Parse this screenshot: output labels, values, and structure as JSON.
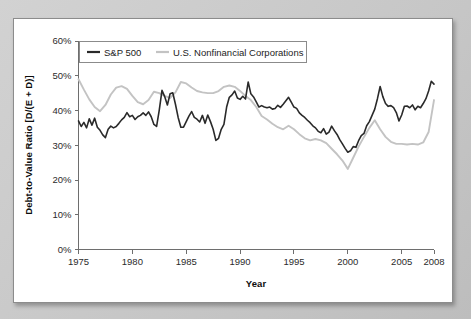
{
  "figure": {
    "background_color": "#ffffff",
    "page_background_color": "#c9c9c9",
    "border_color": "#8c8c8c"
  },
  "chart_data": {
    "type": "line",
    "title": "",
    "xlabel": "Year",
    "ylabel": "Debt-to-Value Ratio [D/(E + D)]",
    "xlim": [
      1975,
      2008
    ],
    "ylim": [
      0,
      60
    ],
    "grid": false,
    "legend_position": "top-left-inside",
    "xticks": [
      1975,
      1980,
      1985,
      1990,
      1995,
      2000,
      2005,
      2008
    ],
    "xticklabels": [
      "1975",
      "1980",
      "1985",
      "1990",
      "1995",
      "2000",
      "2005",
      "2008"
    ],
    "yticks": [
      0,
      10,
      20,
      30,
      40,
      50,
      60
    ],
    "yticklabels": [
      "0%",
      "10%",
      "20%",
      "30%",
      "40%",
      "50%",
      "60%"
    ],
    "series": [
      {
        "name": "S&P 500",
        "color": "#2a2a2a",
        "width": 1.6,
        "x": [
          1975.0,
          1975.25,
          1975.5,
          1975.75,
          1976.0,
          1976.25,
          1976.5,
          1976.75,
          1977.0,
          1977.25,
          1977.5,
          1977.75,
          1978.0,
          1978.25,
          1978.5,
          1978.75,
          1979.0,
          1979.25,
          1979.5,
          1979.75,
          1980.0,
          1980.25,
          1980.5,
          1980.75,
          1981.0,
          1981.25,
          1981.5,
          1981.75,
          1982.0,
          1982.25,
          1982.5,
          1982.75,
          1983.0,
          1983.25,
          1983.5,
          1983.75,
          1984.0,
          1984.25,
          1984.5,
          1984.75,
          1985.0,
          1985.25,
          1985.5,
          1985.75,
          1986.0,
          1986.25,
          1986.5,
          1986.75,
          1987.0,
          1987.25,
          1987.5,
          1987.75,
          1988.0,
          1988.25,
          1988.5,
          1988.75,
          1989.0,
          1989.25,
          1989.5,
          1989.75,
          1990.0,
          1990.25,
          1990.5,
          1990.75,
          1991.0,
          1991.25,
          1991.5,
          1991.75,
          1992.0,
          1992.25,
          1992.5,
          1992.75,
          1993.0,
          1993.25,
          1993.5,
          1993.75,
          1994.0,
          1994.25,
          1994.5,
          1994.75,
          1995.0,
          1995.25,
          1995.5,
          1995.75,
          1996.0,
          1996.25,
          1996.5,
          1996.75,
          1997.0,
          1997.25,
          1997.5,
          1997.75,
          1998.0,
          1998.25,
          1998.5,
          1998.75,
          1999.0,
          1999.25,
          1999.5,
          1999.75,
          2000.0,
          2000.25,
          2000.5,
          2000.75,
          2001.0,
          2001.25,
          2001.5,
          2001.75,
          2002.0,
          2002.25,
          2002.5,
          2002.75,
          2003.0,
          2003.25,
          2003.5,
          2003.75,
          2004.0,
          2004.25,
          2004.5,
          2004.75,
          2005.0,
          2005.25,
          2005.5,
          2005.75,
          2006.0,
          2006.25,
          2006.5,
          2006.75,
          2007.0,
          2007.25,
          2007.5,
          2007.75,
          2008.0
        ],
        "y": [
          37.0,
          35.4,
          36.6,
          35.0,
          37.6,
          35.8,
          37.8,
          35.2,
          34.3,
          33.0,
          32.2,
          34.6,
          35.5,
          35.0,
          35.4,
          36.3,
          37.3,
          38.0,
          39.4,
          38.2,
          38.6,
          37.4,
          38.2,
          38.6,
          39.3,
          38.6,
          39.6,
          38.2,
          36.0,
          35.4,
          40.2,
          45.8,
          44.0,
          41.6,
          44.8,
          45.1,
          41.8,
          38.0,
          35.2,
          35.2,
          36.8,
          38.4,
          39.7,
          38.0,
          37.5,
          36.7,
          38.6,
          36.3,
          38.7,
          36.8,
          34.6,
          31.4,
          32.0,
          34.6,
          36.0,
          41.0,
          43.8,
          44.5,
          45.6,
          43.6,
          43.2,
          44.1,
          43.3,
          48.2,
          44.8,
          43.9,
          42.5,
          41.0,
          41.4,
          41.0,
          40.8,
          41.0,
          40.4,
          40.6,
          41.5,
          40.9,
          41.8,
          42.8,
          43.8,
          42.4,
          41.0,
          40.6,
          39.3,
          38.6,
          38.0,
          37.2,
          36.5,
          35.6,
          35.0,
          34.0,
          33.6,
          34.8,
          33.2,
          33.8,
          35.5,
          34.2,
          33.1,
          31.6,
          30.4,
          29.1,
          28.0,
          28.4,
          29.6,
          29.4,
          31.3,
          32.8,
          33.4,
          35.6,
          36.8,
          38.6,
          40.4,
          43.4,
          46.9,
          44.0,
          42.0,
          41.2,
          41.4,
          40.8,
          39.4,
          37.0,
          38.7,
          41.2,
          41.3,
          40.8,
          41.6,
          40.2,
          41.2,
          40.8,
          42.0,
          43.4,
          45.6,
          48.4,
          47.6
        ]
      },
      {
        "name": "U.S. Nonfinancial Corporations",
        "color": "#c3c3c3",
        "width": 1.9,
        "x": [
          1975.0,
          1975.5,
          1976.0,
          1976.5,
          1977.0,
          1977.5,
          1978.0,
          1978.5,
          1979.0,
          1979.5,
          1980.0,
          1980.5,
          1981.0,
          1981.5,
          1982.0,
          1982.5,
          1983.0,
          1983.5,
          1984.0,
          1984.5,
          1985.0,
          1985.5,
          1986.0,
          1986.5,
          1987.0,
          1987.5,
          1988.0,
          1988.5,
          1989.0,
          1989.5,
          1990.0,
          1990.5,
          1991.0,
          1991.5,
          1992.0,
          1992.5,
          1993.0,
          1993.5,
          1994.0,
          1994.5,
          1995.0,
          1995.5,
          1996.0,
          1996.5,
          1997.0,
          1997.5,
          1998.0,
          1998.5,
          1999.0,
          1999.5,
          2000.0,
          2000.5,
          2001.0,
          2001.5,
          2002.0,
          2002.5,
          2003.0,
          2003.5,
          2004.0,
          2004.5,
          2005.0,
          2005.5,
          2006.0,
          2006.5,
          2007.0,
          2007.5,
          2008.0
        ],
        "y": [
          49.0,
          46.0,
          43.2,
          41.0,
          39.8,
          41.6,
          44.6,
          46.6,
          47.0,
          46.2,
          44.2,
          42.4,
          41.8,
          43.0,
          45.4,
          45.0,
          44.2,
          43.6,
          45.2,
          48.2,
          47.8,
          46.6,
          45.6,
          45.2,
          45.0,
          45.0,
          45.6,
          46.8,
          47.2,
          46.8,
          45.6,
          44.2,
          43.0,
          41.0,
          38.4,
          37.4,
          36.2,
          35.2,
          34.6,
          35.6,
          34.6,
          33.2,
          32.0,
          31.4,
          31.8,
          31.4,
          30.6,
          29.0,
          27.4,
          25.6,
          23.2,
          26.4,
          29.6,
          32.4,
          35.0,
          37.2,
          34.6,
          32.4,
          31.0,
          30.4,
          30.4,
          30.2,
          30.4,
          30.2,
          30.8,
          33.8,
          43.0
        ]
      }
    ]
  },
  "legend": {
    "entries": [
      {
        "label": "S&P 500",
        "color": "#2a2a2a"
      },
      {
        "label": "U.S. Nonfinancial Corporations",
        "color": "#c3c3c3"
      }
    ]
  }
}
